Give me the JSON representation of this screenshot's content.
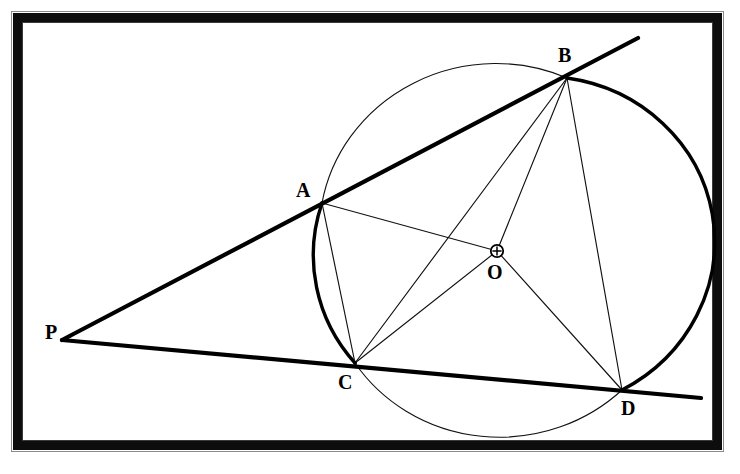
{
  "figure": {
    "background_color": "#ffffff",
    "ink_color": "#000000",
    "frame": {
      "style": "thick black photo border",
      "color": "#0d0d0d"
    },
    "circle": {
      "center_label": "O",
      "center_marker": "circled-plus",
      "cx": 494,
      "cy": 237,
      "rx": 175,
      "ry": 167,
      "rotation_deg": -6
    },
    "points": [
      {
        "id": "P",
        "label": "P",
        "x": 70,
        "y": 336,
        "label_x": 45,
        "label_y": 322,
        "on_circle": false
      },
      {
        "id": "A",
        "label": "A",
        "x": 322,
        "y": 203,
        "label_x": 296,
        "label_y": 180,
        "on_circle": true
      },
      {
        "id": "B",
        "label": "B",
        "x": 567,
        "y": 78,
        "label_x": 558,
        "label_y": 45,
        "on_circle": true
      },
      {
        "id": "C",
        "label": "C",
        "x": 355,
        "y": 363,
        "label_x": 338,
        "label_y": 372,
        "on_circle": true
      },
      {
        "id": "D",
        "label": "D",
        "x": 622,
        "y": 390,
        "label_x": 621,
        "label_y": 398,
        "on_circle": true
      },
      {
        "id": "O",
        "label": "O",
        "x": 497,
        "y": 251,
        "label_x": 487,
        "label_y": 262,
        "on_circle": false
      }
    ],
    "secants": [
      {
        "id": "PAB",
        "from": "P",
        "through": [
          "A",
          "B"
        ],
        "weight": "thick",
        "x1": 62,
        "y1": 340,
        "x2": 638,
        "y2": 38
      },
      {
        "id": "PCD",
        "from": "P",
        "through": [
          "C",
          "D"
        ],
        "weight": "thick",
        "x1": 62,
        "y1": 340,
        "x2": 701,
        "y2": 398
      }
    ],
    "chords": [
      {
        "id": "AC",
        "from": "A",
        "to": "C",
        "weight": "thin"
      },
      {
        "id": "CB",
        "from": "C",
        "to": "B",
        "weight": "thin"
      },
      {
        "id": "BD",
        "from": "B",
        "to": "D",
        "weight": "thin"
      }
    ],
    "radii": [
      {
        "id": "OA",
        "from": "O",
        "to": "A",
        "weight": "thin"
      },
      {
        "id": "OB",
        "from": "O",
        "to": "B",
        "weight": "thin"
      },
      {
        "id": "OC",
        "from": "O",
        "to": "C",
        "weight": "thin"
      },
      {
        "id": "OD",
        "from": "O",
        "to": "D",
        "weight": "thin"
      }
    ],
    "arcs": [
      {
        "id": "arc-A-to-B-top",
        "endpoints": [
          "A",
          "B"
        ],
        "weight": "thin"
      },
      {
        "id": "arc-B-to-D-right",
        "endpoints": [
          "B",
          "D"
        ],
        "weight": "thick"
      },
      {
        "id": "arc-D-to-C-bottom",
        "endpoints": [
          "D",
          "C"
        ],
        "weight": "thin"
      },
      {
        "id": "arc-C-to-A-left",
        "endpoints": [
          "C",
          "A"
        ],
        "weight": "thick"
      }
    ]
  }
}
